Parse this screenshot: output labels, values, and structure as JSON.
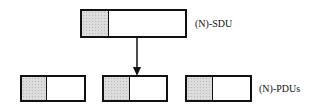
{
  "diagram": {
    "sdu": {
      "label": "(N)-SDU",
      "header_shading": "#dcdcdc"
    },
    "pdus": {
      "label": "(N)-PDUs",
      "count": 3
    },
    "arrow": {
      "from": "sdu",
      "to": "pdu-2",
      "direction": "down"
    }
  }
}
